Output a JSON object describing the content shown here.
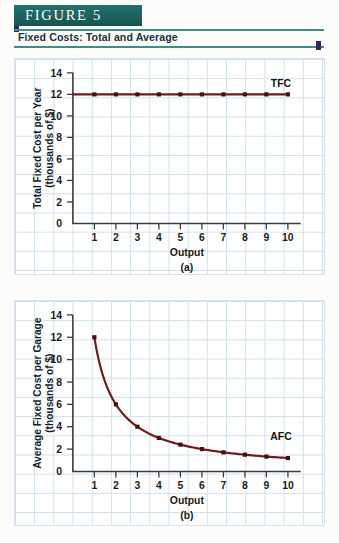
{
  "figure": {
    "banner_label": "FIGURE  5",
    "subtitle": "Fixed Costs: Total and Average"
  },
  "colors": {
    "banner": "#1d625e",
    "accent": "#2e2a55",
    "rule": "#3c8f88",
    "curve": "#6d1d1d",
    "grid": "#cfe0ee"
  },
  "chart_data": [
    {
      "type": "line",
      "panel": "(a)",
      "title": "",
      "xlabel": "Output",
      "ylabel": "Total Fixed Cost per Year (thousands of $)",
      "ylabel_line1": "Total Fixed Cost per Year",
      "ylabel_line2": "(thousands of $)",
      "x": [
        1,
        2,
        3,
        4,
        5,
        6,
        7,
        8,
        9,
        10
      ],
      "values": [
        12,
        12,
        12,
        12,
        12,
        12,
        12,
        12,
        12,
        12
      ],
      "series": [
        {
          "name": "TFC",
          "values": [
            12,
            12,
            12,
            12,
            12,
            12,
            12,
            12,
            12,
            12
          ]
        }
      ],
      "annotations": [
        "TFC"
      ],
      "series_label": "TFC",
      "xlim": [
        0,
        10.6
      ],
      "ylim": [
        0,
        14
      ],
      "xticks": [
        1,
        2,
        3,
        4,
        5,
        6,
        7,
        8,
        9,
        10
      ],
      "yticks": [
        0,
        2,
        4,
        6,
        8,
        10,
        12,
        14
      ],
      "xtick_labels": [
        "1",
        "2",
        "3",
        "4",
        "5",
        "6",
        "7",
        "8",
        "9",
        "10"
      ],
      "ytick_labels": [
        "0",
        "2",
        "4",
        "6",
        "8",
        "10",
        "12",
        "14"
      ],
      "grid": true,
      "legend": "none"
    },
    {
      "type": "line",
      "panel": "(b)",
      "title": "",
      "xlabel": "Output",
      "ylabel": "Average Fixed Cost per Garage (thousands of $)",
      "ylabel_line1": "Average Fixed Cost per Garage",
      "ylabel_line2": "(thousands of $)",
      "x": [
        1,
        2,
        3,
        4,
        5,
        6,
        7,
        8,
        9,
        10
      ],
      "values": [
        12,
        6,
        4,
        3,
        2.4,
        2,
        1.71,
        1.5,
        1.33,
        1.2
      ],
      "series": [
        {
          "name": "AFC",
          "values": [
            12,
            6,
            4,
            3,
            2.4,
            2,
            1.71,
            1.5,
            1.33,
            1.2
          ]
        }
      ],
      "annotations": [
        "AFC"
      ],
      "series_label": "AFC",
      "xlim": [
        0,
        10.6
      ],
      "ylim": [
        0,
        14
      ],
      "xticks": [
        1,
        2,
        3,
        4,
        5,
        6,
        7,
        8,
        9,
        10
      ],
      "yticks": [
        0,
        2,
        4,
        6,
        8,
        10,
        12,
        14
      ],
      "xtick_labels": [
        "1",
        "2",
        "3",
        "4",
        "5",
        "6",
        "7",
        "8",
        "9",
        "10"
      ],
      "ytick_labels": [
        "0",
        "2",
        "4",
        "6",
        "8",
        "10",
        "12",
        "14"
      ],
      "grid": true,
      "legend": "none"
    }
  ]
}
